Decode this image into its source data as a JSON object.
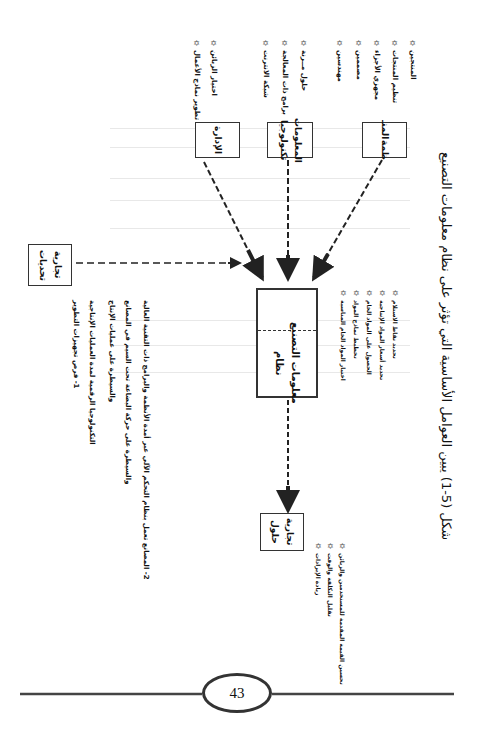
{
  "page": {
    "page_number": "43",
    "orientation": "rotated-90-clockwise"
  },
  "figure": {
    "caption": "شكل (5-1) يبين العوامل الأساسية التي تؤثر على نظام معلومات التصنيع",
    "central_box": {
      "label_line1": "نظام",
      "label_line2": "معلومات التصنيع"
    },
    "top_boxes": [
      {
        "id": "management",
        "label_line1": "الإدارة",
        "label_line2": "",
        "items": [
          "تطوير نماذج الأعمال",
          "اختيار الزبائن"
        ]
      },
      {
        "id": "it",
        "label_line1": "تكنولوجيا",
        "label_line2": "المعلومات",
        "items": [
          "شبكة الانترنت",
          "برامج ذات المعالجة",
          "حلول مــرنة"
        ]
      },
      {
        "id": "organization",
        "label_line1": "المنـ",
        "label_line2": "ظمة",
        "items": [
          "مهندسين",
          "مصممين",
          "مجهزي الأجزاء",
          "تنظيم المنتجات",
          "المنتجين"
        ]
      }
    ],
    "challenges_box": {
      "label_line1": "تحديات",
      "label_line2": "تجارية",
      "notes": [
        "1- فرص تجهيزات التطوير",
        "التكنولوجيا الرقمية لمدة العمليات الإنتاجية",
        "والسيطرة على عمليات الإنتاج",
        "والسيطرة على حركة البضاعة تحت السيم في المصانع",
        "2- المصانع تعمل بنظام التحكم الآلي عبر أمدة الأنظمة والبرامج ذات التقنية العالية"
      ]
    },
    "central_box_items": [
      "اختيار المواد الخام المناسبة",
      "تخطيط نماذج المواد",
      "الحصول على المواد الخام",
      "تحديد أسعار المواد الإنتاجية",
      "تحديد نقاط الاستلام"
    ],
    "solutions_box": {
      "label_line1": "حلول",
      "label_line2": "تجارية",
      "items": [
        "زيادة الإيرادات",
        "تقليل التكلفة والوقت",
        "تحسين القيمة المقدمة للمستخدمين والزبائن"
      ]
    }
  },
  "icons": {
    "bullet": "✡"
  }
}
